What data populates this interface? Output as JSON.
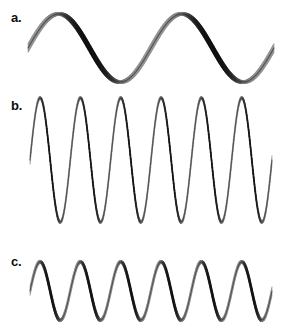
{
  "figure": {
    "width": 281,
    "height": 336,
    "background_color": "#ffffff"
  },
  "panels": [
    {
      "id": "a",
      "label": "a.",
      "label_x": 11,
      "label_y": 11,
      "wave_type": "sine-ribbon",
      "cycles": 2,
      "amplitude_px": 34,
      "baseline_y": 48,
      "x_start": 28,
      "x_end": 274,
      "ribbon_width_px": 9,
      "colors": {
        "dark": "#141414",
        "mid": "#555555",
        "light": "#d8d8d8",
        "highlight": "#f2f2f2"
      }
    },
    {
      "id": "b",
      "label": "b.",
      "label_x": 11,
      "label_y": 99,
      "wave_type": "sine-ribbon",
      "cycles": 6,
      "amplitude_px": 62,
      "baseline_y": 160,
      "x_start": 30,
      "x_end": 272,
      "ribbon_width_px": 9,
      "colors": {
        "dark": "#141414",
        "mid": "#555555",
        "light": "#d8d8d8",
        "highlight": "#f2f2f2"
      }
    },
    {
      "id": "c",
      "label": "c.",
      "label_x": 11,
      "label_y": 255,
      "wave_type": "sine-ribbon",
      "cycles": 6,
      "amplitude_px": 29,
      "baseline_y": 291,
      "x_start": 30,
      "x_end": 272,
      "ribbon_width_px": 9,
      "colors": {
        "dark": "#141414",
        "mid": "#555555",
        "light": "#d8d8d8",
        "highlight": "#f2f2f2"
      }
    }
  ],
  "chart_data": {
    "type": "line",
    "title": "",
    "xlabel": "",
    "ylabel": "",
    "grid": false,
    "legend_position": "none",
    "series": [
      {
        "name": "a",
        "label": "a.",
        "function": "sine",
        "cycles": 2,
        "amplitude": 34,
        "wavelength_px": 123,
        "phase": 0,
        "baseline_y": 48
      },
      {
        "name": "b",
        "label": "b.",
        "function": "sine",
        "cycles": 6,
        "amplitude": 62,
        "wavelength_px": 40,
        "phase": 0,
        "baseline_y": 160
      },
      {
        "name": "c",
        "label": "c.",
        "function": "sine",
        "cycles": 6,
        "amplitude": 29,
        "wavelength_px": 40,
        "phase": 0,
        "baseline_y": 291
      }
    ]
  }
}
